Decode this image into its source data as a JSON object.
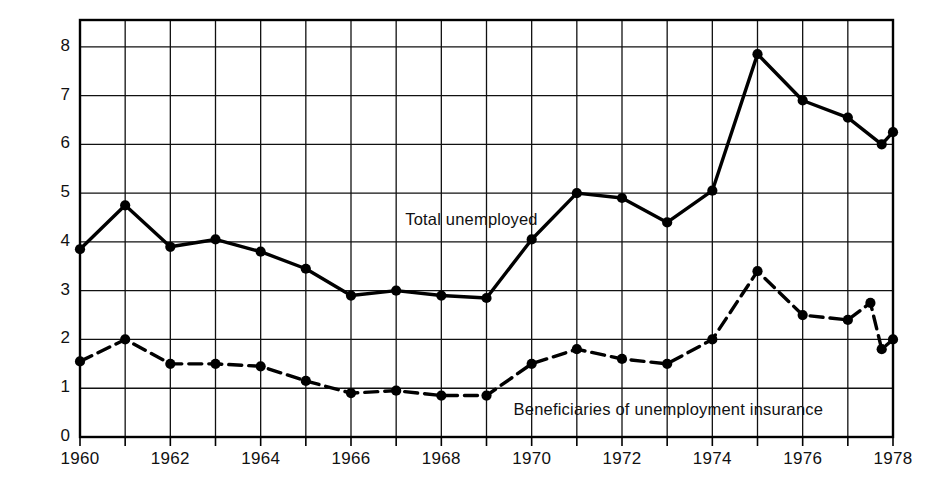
{
  "chart_data": {
    "type": "line",
    "title": "",
    "xlabel": "",
    "ylabel": "Millions of unemployed",
    "xlim": [
      1960,
      1978
    ],
    "ylim": [
      0,
      8.55
    ],
    "ytick_labels": [
      "0",
      "1",
      "2",
      "3",
      "4",
      "5",
      "6",
      "7",
      "8"
    ],
    "ytick_values": [
      0,
      1,
      2,
      3,
      4,
      5,
      6,
      7,
      8
    ],
    "xtick_labels": [
      "1960",
      "1962",
      "1964",
      "1966",
      "1968",
      "1970",
      "1972",
      "1974",
      "1976",
      "1978"
    ],
    "xtick_values": [
      1960,
      1962,
      1964,
      1966,
      1968,
      1970,
      1972,
      1974,
      1976,
      1978
    ],
    "minor_xticks": [
      1961,
      1963,
      1965,
      1967,
      1969,
      1971,
      1973,
      1975,
      1977
    ],
    "grid": true,
    "grid_color": "#111111",
    "legend_position": "inline-annotation",
    "series": [
      {
        "name": "Total unemployed",
        "style": "solid",
        "color": "#000000",
        "marker": "filled-circle",
        "x": [
          1960,
          1961,
          1962,
          1963,
          1964,
          1965,
          1966,
          1967,
          1968,
          1969,
          1970,
          1971,
          1972,
          1973,
          1974,
          1975,
          1976,
          1977,
          1977.75,
          1978
        ],
        "values": [
          3.85,
          4.75,
          3.9,
          4.05,
          3.8,
          3.45,
          2.9,
          3.0,
          2.9,
          2.85,
          4.05,
          5.0,
          4.9,
          4.4,
          5.05,
          7.85,
          6.9,
          6.55,
          6.0,
          6.25
        ]
      },
      {
        "name": "Beneficiaries of unemployment insurance",
        "style": "dashed",
        "color": "#000000",
        "marker": "filled-circle",
        "x": [
          1960,
          1961,
          1962,
          1963,
          1964,
          1965,
          1966,
          1967,
          1968,
          1969,
          1970,
          1971,
          1972,
          1973,
          1974,
          1975,
          1976,
          1977,
          1977.5,
          1977.75,
          1978
        ],
        "values": [
          1.55,
          2.0,
          1.5,
          1.5,
          1.45,
          1.15,
          0.9,
          0.95,
          0.85,
          0.85,
          1.5,
          1.8,
          1.6,
          1.5,
          2.0,
          3.4,
          2.5,
          2.4,
          2.75,
          1.8,
          2.0
        ]
      }
    ],
    "annotations": [
      {
        "text": "Total unemployed",
        "x": 1967.2,
        "y": 4.45
      },
      {
        "text": "Beneficiaries of unemployment insurance",
        "x": 1969.6,
        "y": 0.55
      }
    ]
  }
}
